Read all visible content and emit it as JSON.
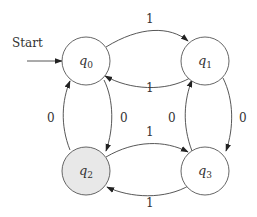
{
  "diagram": {
    "type": "finite-state-automaton",
    "start_label": "Start",
    "start_state": "q0",
    "colors": {
      "node_fill": "#ffffff",
      "accept_fill": "#e8e8e8",
      "stroke": "#555555"
    },
    "states": [
      {
        "id": "q0",
        "base": "q",
        "sub": "0",
        "accepting": false
      },
      {
        "id": "q1",
        "base": "q",
        "sub": "1",
        "accepting": false
      },
      {
        "id": "q2",
        "base": "q",
        "sub": "2",
        "accepting": true
      },
      {
        "id": "q3",
        "base": "q",
        "sub": "3",
        "accepting": false
      }
    ],
    "transitions": [
      {
        "from": "q0",
        "to": "q1",
        "label": "1"
      },
      {
        "from": "q1",
        "to": "q0",
        "label": "1"
      },
      {
        "from": "q2",
        "to": "q0",
        "label": "0"
      },
      {
        "from": "q0",
        "to": "q2",
        "label": "0"
      },
      {
        "from": "q3",
        "to": "q1",
        "label": "0"
      },
      {
        "from": "q1",
        "to": "q3",
        "label": "0"
      },
      {
        "from": "q2",
        "to": "q3",
        "label": "1"
      },
      {
        "from": "q3",
        "to": "q2",
        "label": "1"
      }
    ]
  }
}
